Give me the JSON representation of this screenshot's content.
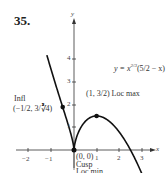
{
  "problem_number": "35.",
  "chart_data": {
    "type": "line",
    "title": "",
    "equation": "y = x^{2/3}(5/2 − x)",
    "equation_display": "y = x^{2/3}(5/2 − x)",
    "xlabel": "x",
    "ylabel": "y",
    "xlim": [
      -2.3,
      3.3
    ],
    "ylim": [
      -1.1,
      4.8
    ],
    "x_ticks": [
      -2,
      -1,
      1,
      2,
      3
    ],
    "y_ticks": [
      1,
      2,
      3,
      4
    ],
    "grid": false,
    "series": [
      {
        "name": "y = x^(2/3)(5/2 - x)",
        "x": [
          -1.2,
          -1.0,
          -0.75,
          -0.5,
          -0.25,
          -0.1,
          0,
          0.1,
          0.25,
          0.5,
          0.75,
          1.0,
          1.5,
          2.0,
          2.5,
          2.8,
          3.0
        ],
        "y": [
          4.18,
          3.5,
          2.67,
          1.89,
          1.09,
          0.56,
          0,
          0.52,
          0.89,
          1.26,
          1.44,
          1.5,
          1.31,
          0.79,
          0,
          -0.59,
          -1.04
        ]
      }
    ],
    "annotations": [
      {
        "point": [
          -0.5,
          1.89
        ],
        "label": "Infl",
        "sublabel": "(−1/2, 3/∛4)"
      },
      {
        "point": [
          1,
          1.5
        ],
        "label": "(1, 3/2) Loc max"
      },
      {
        "point": [
          0,
          0
        ],
        "label": "(0, 0)",
        "sublabel": "Cusp",
        "sublabel2": "Loc min"
      }
    ]
  },
  "labels": {
    "equation": "y = x",
    "equation_exp": "2/3",
    "equation_paren": "(5/2 − x)",
    "infl": "Infl",
    "infl_coords": "(−1/2, 3/∛4)",
    "loc_max": "(1, 3/2) Loc max",
    "origin": "(0, 0)",
    "cusp": "Cusp",
    "loc_min": "Loc min",
    "x_axis": "x",
    "y_axis": "y",
    "x_ticks": [
      "−2",
      "−1",
      "1",
      "2",
      "3"
    ],
    "y_ticks": [
      "1",
      "2",
      "3",
      "4"
    ]
  }
}
